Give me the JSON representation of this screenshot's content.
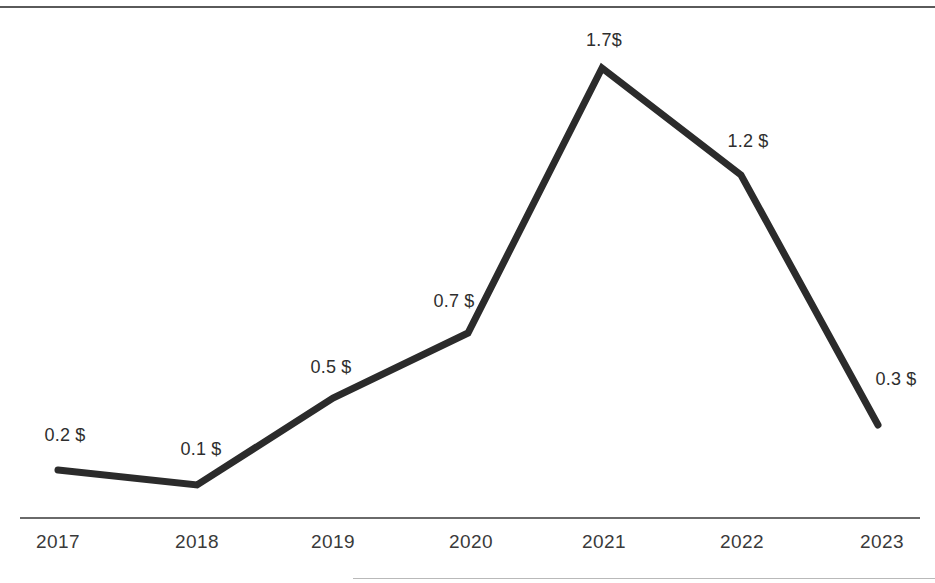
{
  "chart_data": {
    "type": "line",
    "title": "",
    "subtitle": "",
    "xlabel": "",
    "ylabel": "",
    "categories": [
      "2017",
      "2018",
      "2019",
      "2020",
      "2021",
      "2022",
      "2023"
    ],
    "values": [
      0.2,
      0.1,
      0.5,
      0.7,
      1.7,
      1.2,
      0.3
    ],
    "point_labels": [
      "0.2 $",
      "0.1 $",
      "0.5 $",
      "0.7 $",
      "1.7$",
      "1.2 $",
      "0.3 $"
    ],
    "series": [
      {
        "name": "",
        "values": [
          0.2,
          0.1,
          0.5,
          0.7,
          1.7,
          1.2,
          0.3
        ]
      }
    ],
    "ylim": [
      0,
      1.85
    ],
    "grid": false,
    "legend": "none",
    "unit": "$",
    "line_color": "#2b2b2b",
    "label_color": "#2e2e2e",
    "axis_color": "#6a6a6a",
    "background_color": "#ffffff"
  },
  "axis": {
    "ticks": [
      {
        "label": "2017",
        "x": 58
      },
      {
        "label": "2018",
        "x": 197
      },
      {
        "label": "2019",
        "x": 333
      },
      {
        "label": "2020",
        "x": 471
      },
      {
        "label": "2021",
        "x": 604
      },
      {
        "label": "2022",
        "x": 742
      },
      {
        "label": "2023",
        "x": 882
      }
    ]
  },
  "points": [
    {
      "label": "0.2 $",
      "px": 58,
      "py": 470,
      "lx": 65,
      "ly": 425
    },
    {
      "label": "0.1 $",
      "px": 197,
      "py": 485,
      "lx": 201,
      "ly": 439
    },
    {
      "label": "0.5 $",
      "px": 333,
      "py": 398,
      "lx": 331,
      "ly": 357
    },
    {
      "label": "0.7 $",
      "px": 468,
      "py": 333,
      "lx": 454,
      "ly": 291
    },
    {
      "label": "1.7$",
      "px": 602,
      "py": 68,
      "lx": 604,
      "ly": 30
    },
    {
      "label": "1.2 $",
      "px": 741,
      "py": 175,
      "lx": 748,
      "ly": 131
    },
    {
      "label": "0.3 $",
      "px": 878,
      "py": 425,
      "lx": 896,
      "ly": 369
    }
  ],
  "polyline": "58,470 197,485 333,398 468,333 602,68 741,175 878,425"
}
